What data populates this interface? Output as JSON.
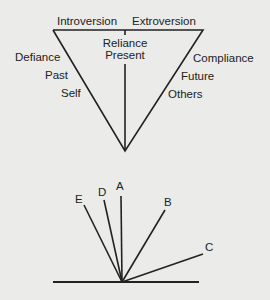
{
  "top_diagram": {
    "top_left_label": "Introversion",
    "top_right_label": "Extroversion",
    "center_labels": [
      "Reliance",
      "Present"
    ],
    "left_labels": [
      "Defiance",
      "Past",
      "Self"
    ],
    "right_labels": [
      "Compliance",
      "Future",
      "Others"
    ]
  },
  "bottom_diagram": {
    "lines": [
      "A",
      "B",
      "C",
      "D",
      "E"
    ]
  },
  "colors": {
    "background": "#ebebea",
    "ink": "#222222"
  }
}
